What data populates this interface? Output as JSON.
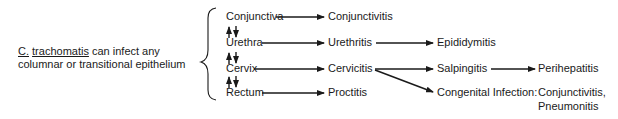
{
  "intro": {
    "organism_abbrev": "C.",
    "organism_species": "trachomatis",
    "line1_rest": " can infect any",
    "line2": "columnar or transitional epithelium"
  },
  "sites": {
    "conjunctiva": "Conjunctiva",
    "urethra": "Urethra",
    "cervix": "Cervix",
    "rectum": "Rectum"
  },
  "infections": {
    "conjunctivitis": "Conjunctivitis",
    "urethritis": "Urethritis",
    "cervicitis": "Cervicitis",
    "proctitis": "Proctitis"
  },
  "complications": {
    "epididymitis": "Epididymitis",
    "salpingitis": "Salpingitis",
    "congenital": "Congenital Infection:",
    "perihepatitis": "Perihepatitis",
    "congenital_1": "Conjunctivitis,",
    "congenital_2": "Pneumonitis"
  },
  "style": {
    "ink_color": "#1a1a1a",
    "background": "#ffffff"
  }
}
